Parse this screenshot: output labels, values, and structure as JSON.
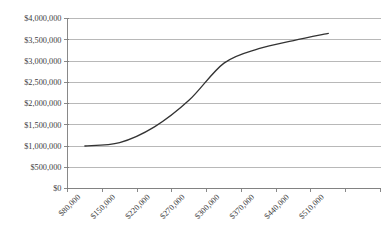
{
  "chart_data": {
    "type": "line",
    "title": "",
    "xlabel": "",
    "ylabel": "",
    "categories": [
      "$80,000",
      "$150,000",
      "$220,000",
      "$270,000",
      "$300,000",
      "$370,000",
      "$440,000",
      "$510,000"
    ],
    "x": [
      80000,
      150000,
      220000,
      270000,
      300000,
      370000,
      440000,
      510000
    ],
    "values": [
      1000000,
      1080000,
      1450000,
      2080000,
      2950000,
      3290000,
      3480000,
      3650000
    ],
    "series": [
      {
        "name": "",
        "values": [
          1000000,
          1080000,
          1450000,
          2080000,
          2950000,
          3290000,
          3480000,
          3650000
        ]
      }
    ],
    "ylim": [
      0,
      4000000
    ],
    "ytick_values": [
      0,
      500000,
      1000000,
      1500000,
      2000000,
      2500000,
      3000000,
      3500000,
      4000000
    ],
    "ytick_labels": [
      "$0",
      "$500,000",
      "$1,000,000",
      "$1,500,000",
      "$2,000,000",
      "$2,500,000",
      "$3,000,000",
      "$3,500,000",
      "$4,000,000"
    ],
    "grid": true,
    "legend": false,
    "legend_position": "none",
    "line_color": "#333333",
    "grid_color": "#9a9a9a",
    "axis_color": "#7c7c7c",
    "background_color": "#ffffff",
    "xtick_label_rotation": -45
  }
}
